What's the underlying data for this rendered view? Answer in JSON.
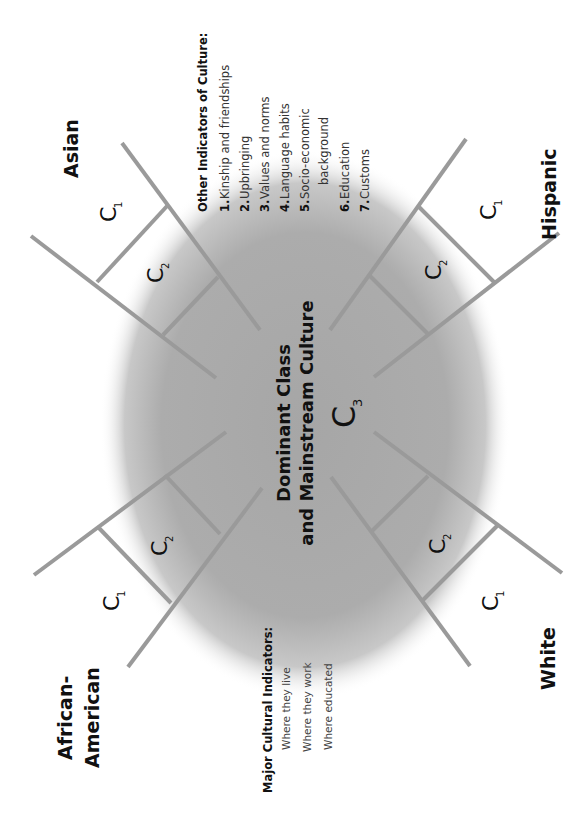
{
  "colors": {
    "background": "#ffffff",
    "ellipse_core": "#a9a9a9",
    "ladder_stroke": "#9a9a9a",
    "text": "#111111"
  },
  "orientation": "rotated 90 degrees counter-clockwise",
  "center": {
    "title_line1": "Dominant Class",
    "title_line2": "and Mainstream Culture",
    "c3_base": "C",
    "c3_sub": "3"
  },
  "groups": [
    {
      "id": "asian",
      "label": "Asian"
    },
    {
      "id": "hispanic",
      "label": "Hispanic"
    },
    {
      "id": "african-american",
      "label_line1": "African-",
      "label_line2": "American"
    },
    {
      "id": "white",
      "label": "White"
    }
  ],
  "ladder_labels": {
    "c1_base": "C",
    "c1_sub": "1",
    "c2_base": "C",
    "c2_sub": "2"
  },
  "other_indicators": {
    "title": "Other Indicators of Culture:",
    "items": [
      {
        "num": "1.",
        "text": "Kinship and friendships"
      },
      {
        "num": "2.",
        "text": "Upbringing"
      },
      {
        "num": "3.",
        "text": "Values and norms"
      },
      {
        "num": "4.",
        "text": "Language habits"
      },
      {
        "num": "5.",
        "text": "Socio-economic",
        "text2": "background"
      },
      {
        "num": "6.",
        "text": "Education"
      },
      {
        "num": "7.",
        "text": "Customs"
      }
    ]
  },
  "major_indicators": {
    "title": "Major Cultural Indicators:",
    "items": [
      "Where they live",
      "Where they work",
      "Where educated"
    ]
  }
}
